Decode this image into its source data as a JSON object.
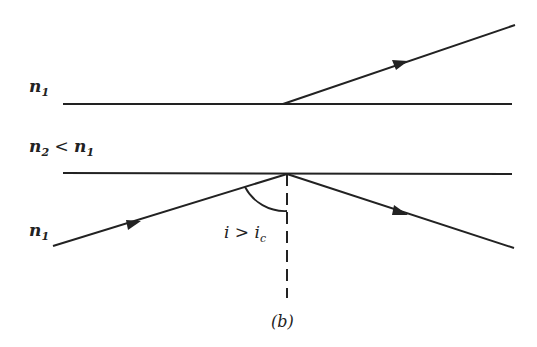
{
  "diagram": {
    "caption": "(b)",
    "media_labels": {
      "top": {
        "n": "n",
        "sub": "1"
      },
      "middle": {
        "n": "n",
        "sub": "2",
        "rel": " < ",
        "n2": "n",
        "sub2": "1"
      },
      "bottom": {
        "n": "n",
        "sub": "1"
      }
    },
    "angle_label": {
      "i": "i",
      "op": " > ",
      "ic": "i",
      "sub": "c"
    },
    "colors": {
      "line": "#222222",
      "background": "#ffffff"
    },
    "elements": [
      "upper interface line",
      "lower interface line",
      "incident ray with arrow",
      "reflected ray with arrow",
      "transmitted (frustrated) ray with arrow",
      "dashed normal",
      "angle arc"
    ]
  }
}
